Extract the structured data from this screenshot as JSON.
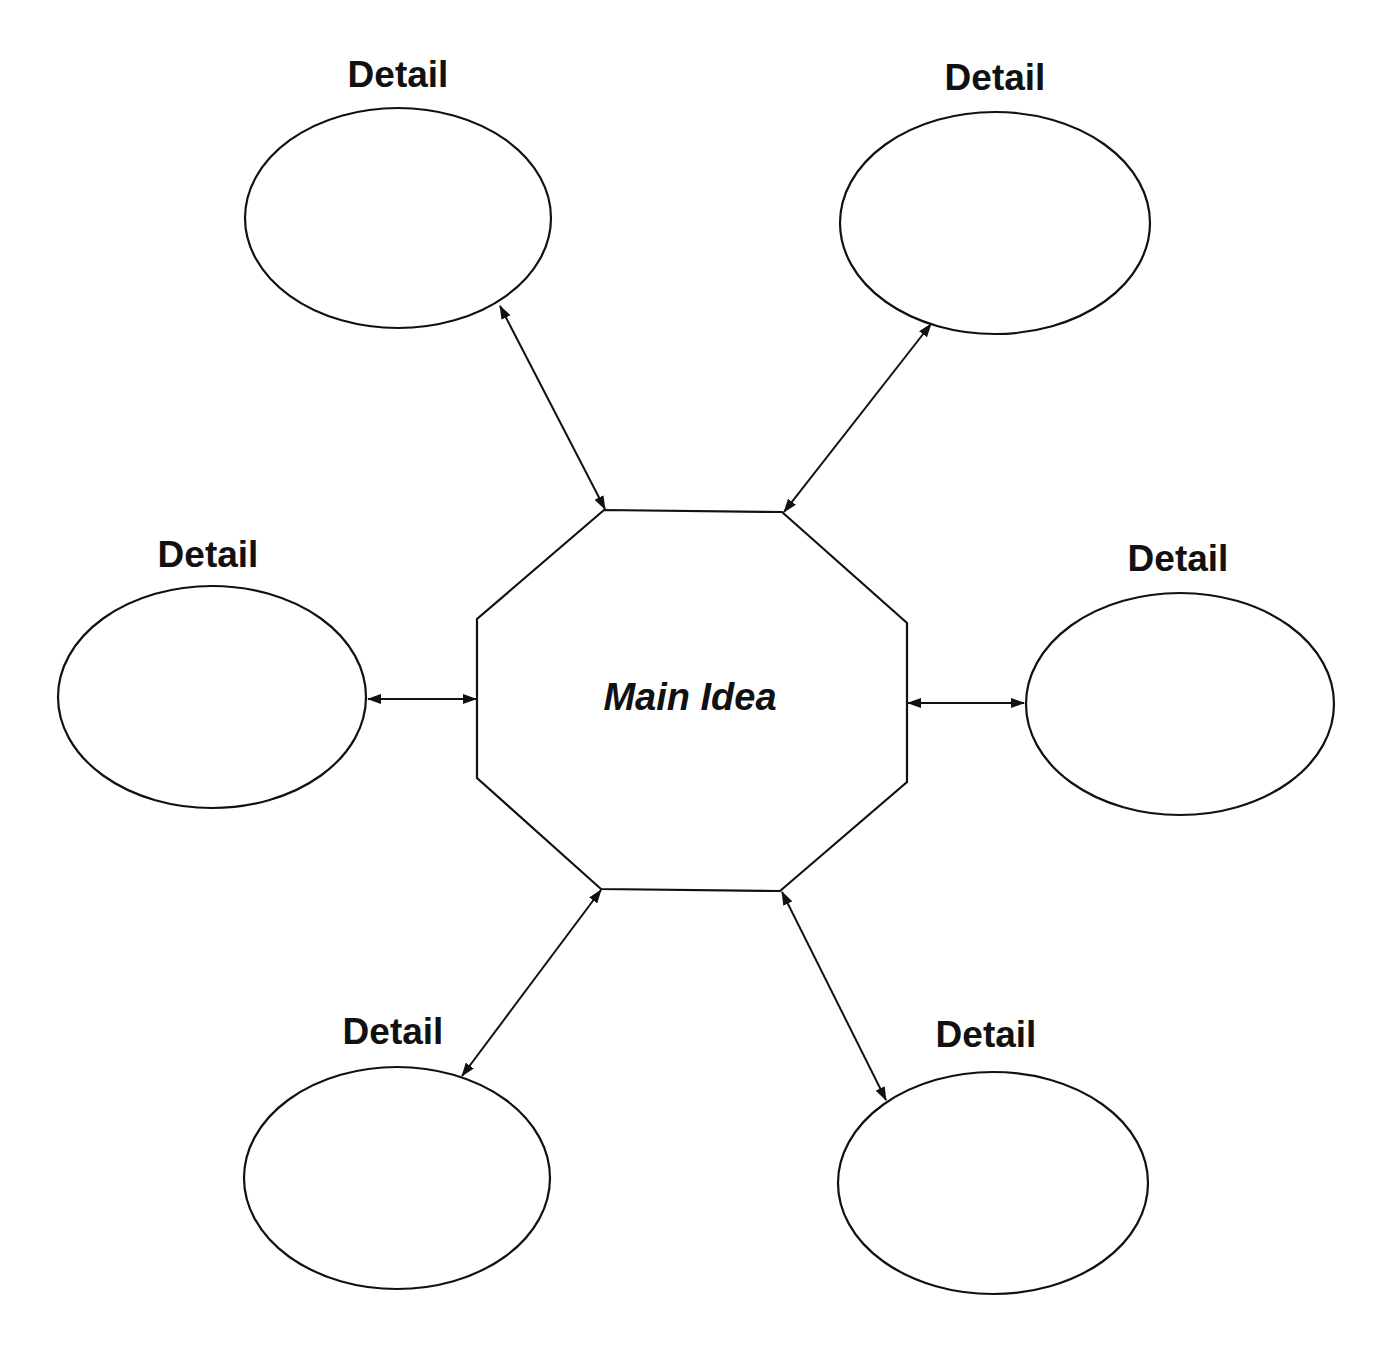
{
  "diagram": {
    "type": "main-idea-and-details web",
    "stroke_color": "#111111",
    "background": "#ffffff",
    "main_idea": {
      "label": "Main Idea",
      "shape": "octagon",
      "points": "604,510 782,512 907,623 907,782 780,891 601,889 477,778 477,619",
      "label_x": 690,
      "label_y": 697
    },
    "details": [
      {
        "id": "top-left",
        "label": "Detail",
        "cx": 398,
        "cy": 218,
        "rx": 153,
        "ry": 110,
        "label_x": 398,
        "label_y": 56
      },
      {
        "id": "top-right",
        "label": "Detail",
        "cx": 995,
        "cy": 223,
        "rx": 155,
        "ry": 111,
        "label_x": 995,
        "label_y": 59
      },
      {
        "id": "left",
        "label": "Detail",
        "cx": 212,
        "cy": 697,
        "rx": 154,
        "ry": 111,
        "label_x": 208,
        "label_y": 536
      },
      {
        "id": "right",
        "label": "Detail",
        "cx": 1180,
        "cy": 704,
        "rx": 154,
        "ry": 111,
        "label_x": 1178,
        "label_y": 540
      },
      {
        "id": "bottom-left",
        "label": "Detail",
        "cx": 397,
        "cy": 1178,
        "rx": 153,
        "ry": 111,
        "label_x": 393,
        "label_y": 1013
      },
      {
        "id": "bottom-right",
        "label": "Detail",
        "cx": 993,
        "cy": 1183,
        "rx": 155,
        "ry": 111,
        "label_x": 986,
        "label_y": 1016
      }
    ],
    "connectors": [
      {
        "id": "top-left",
        "x1": 500,
        "y1": 306,
        "x2": 605,
        "y2": 509
      },
      {
        "id": "top-right",
        "x1": 931,
        "y1": 324,
        "x2": 784,
        "y2": 512
      },
      {
        "id": "left",
        "x1": 368,
        "y1": 699,
        "x2": 476,
        "y2": 699
      },
      {
        "id": "right",
        "x1": 908,
        "y1": 703,
        "x2": 1024,
        "y2": 703
      },
      {
        "id": "bottom-left",
        "x1": 601,
        "y1": 890,
        "x2": 462,
        "y2": 1076
      },
      {
        "id": "bottom-right",
        "x1": 782,
        "y1": 892,
        "x2": 886,
        "y2": 1100
      }
    ]
  }
}
